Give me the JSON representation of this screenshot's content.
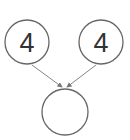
{
  "diagram": {
    "type": "number-bond",
    "parts": [
      {
        "label": "4"
      },
      {
        "label": "4"
      }
    ],
    "whole": {
      "label": ""
    },
    "colors": {
      "stroke": "#666666",
      "text": "#333333",
      "arrow": "#777777"
    }
  }
}
